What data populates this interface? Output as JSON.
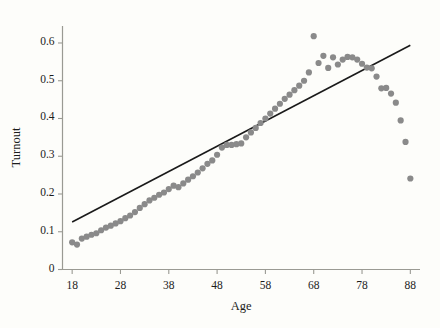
{
  "chart_data": {
    "type": "scatter",
    "title": "",
    "xlabel": "Age",
    "ylabel": "Turnout",
    "xlim": [
      16,
      90
    ],
    "ylim": [
      0,
      0.645
    ],
    "grid": false,
    "legend": null,
    "xticks": [
      18,
      28,
      38,
      48,
      58,
      68,
      78,
      88
    ],
    "xtick_labels": [
      "18",
      "28",
      "38",
      "48",
      "58",
      "68",
      "78",
      "88"
    ],
    "yticks": [
      0,
      0.1,
      0.2,
      0.3,
      0.4,
      0.5,
      0.6
    ],
    "ytick_labels": [
      "0",
      "0.1",
      "0.2",
      "0.3",
      "0.4",
      "0.5",
      "0.6"
    ],
    "marker_color": "#8a8a8a",
    "marker_size": 3.1,
    "line_color": "#1a1a1a",
    "axis_color": "#9a9a93",
    "background_color": "#fdfdfa",
    "series": [
      {
        "name": "Turnout by age",
        "type": "scatter",
        "x": [
          18,
          19,
          20,
          21,
          22,
          23,
          24,
          25,
          26,
          27,
          28,
          29,
          30,
          31,
          32,
          33,
          34,
          35,
          36,
          37,
          38,
          39,
          40,
          41,
          42,
          43,
          44,
          45,
          46,
          47,
          48,
          49,
          50,
          51,
          52,
          53,
          54,
          55,
          56,
          57,
          58,
          59,
          60,
          61,
          62,
          63,
          64,
          65,
          66,
          67,
          68,
          69,
          70,
          71,
          72,
          73,
          74,
          75,
          76,
          77,
          78,
          79,
          80,
          81,
          82,
          83,
          84,
          85,
          86,
          87,
          88
        ],
        "y": [
          0.072,
          0.066,
          0.082,
          0.087,
          0.092,
          0.096,
          0.104,
          0.111,
          0.116,
          0.122,
          0.128,
          0.136,
          0.143,
          0.152,
          0.163,
          0.173,
          0.183,
          0.19,
          0.198,
          0.204,
          0.213,
          0.222,
          0.218,
          0.228,
          0.238,
          0.247,
          0.257,
          0.268,
          0.28,
          0.289,
          0.304,
          0.323,
          0.33,
          0.33,
          0.332,
          0.334,
          0.35,
          0.363,
          0.375,
          0.388,
          0.4,
          0.413,
          0.426,
          0.439,
          0.452,
          0.463,
          0.475,
          0.487,
          0.5,
          0.522,
          0.618,
          0.547,
          0.566,
          0.534,
          0.562,
          0.543,
          0.556,
          0.563,
          0.562,
          0.556,
          0.545,
          0.535,
          0.533,
          0.511,
          0.48,
          0.481,
          0.466,
          0.442,
          0.395,
          0.338,
          0.241
        ]
      },
      {
        "name": "Linear fit",
        "type": "line",
        "x": [
          18,
          88
        ],
        "y": [
          0.126,
          0.594
        ]
      }
    ]
  }
}
